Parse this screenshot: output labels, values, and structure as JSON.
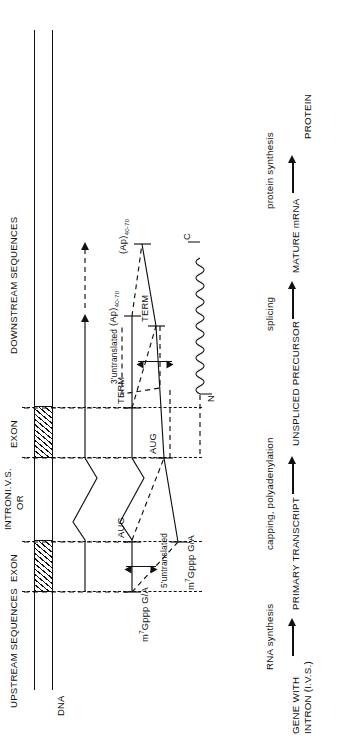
{
  "figure": {
    "orientation": "rotated-90-ccw",
    "ink_color": "#111111",
    "background": "#ffffff"
  },
  "region_labels": {
    "upstream": "UPSTREAM SEQUENCES",
    "downstream": "DOWNSTREAM SEQUENCES",
    "exon_left": "EXON",
    "exon_right": "EXON",
    "intron_line1": "INTRON",
    "intron_line2": "OR",
    "intron_line3": "I.V.S."
  },
  "rows": [
    {
      "id": "dna",
      "stage_label": "GENE WITH\nINTRON (I.V.S.)",
      "stage_label_line1": "GENE WITH",
      "stage_label_line2": "INTRON (I.V.S.)",
      "molecule_label": "DNA",
      "annotations": []
    },
    {
      "id": "primary-transcript",
      "stage_label": "PRIMARY TRANSCRIPT",
      "transition_from_previous": "RNA synthesis",
      "molecule_label": "",
      "annotations": []
    },
    {
      "id": "unspliced-precursor",
      "stage_label": "UNSPLICED PRECURSOR",
      "transition_from_previous": "capping, polyadenylation",
      "cap": "m7Gppp G/A",
      "cap_display": "m⁷Gppp G/A",
      "cap_sup": "7",
      "cap_base": "Gppp G/A",
      "cap_prefix": "m",
      "start_codon": "AUG",
      "stop_codon": "TERM",
      "poly_a": "(Ap)40-70",
      "poly_a_base": "(Ap)",
      "poly_a_sub": "40-70",
      "untranslated_5": "5'untranslated",
      "untranslated_3": "3'untranslated"
    },
    {
      "id": "mature-mrna",
      "stage_label": "MATURE mRNA",
      "transition_from_previous": "splicing",
      "cap_prefix": "m",
      "cap_sup": "7",
      "cap_base": "Gppp G/A",
      "start_codon": "AUG",
      "stop_codon": "TERM",
      "poly_a_base": "(Ap)",
      "poly_a_sub": "40-70"
    },
    {
      "id": "protein",
      "stage_label": "PROTEIN",
      "transition_from_previous": "protein synthesis",
      "n_terminus": "N",
      "c_terminus": "C"
    }
  ],
  "flow_chart": {
    "nodes": [
      "GENE WITH INTRON (I.V.S.)",
      "PRIMARY TRANSCRIPT",
      "UNSPLICED PRECURSOR",
      "MATURE mRNA",
      "PROTEIN"
    ],
    "edges": [
      "RNA synthesis",
      "capping, polyadenylation",
      "splicing",
      "protein synthesis"
    ]
  }
}
